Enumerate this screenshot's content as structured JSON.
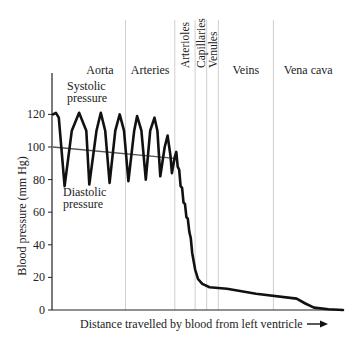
{
  "chart_data": {
    "type": "line",
    "title": "",
    "xlabel": "Distance travelled by blood from left ventricle",
    "ylabel": "Blood pressure (mm Hg)",
    "ylim": [
      0,
      130
    ],
    "yticks": [
      0,
      20,
      40,
      60,
      80,
      100,
      120
    ],
    "grid": false,
    "x_arrow": true,
    "regions": [
      {
        "name": "Aorta",
        "x_start": 0,
        "x_end": 0.25,
        "orientation": "horizontal"
      },
      {
        "name": "Arteries",
        "x_start": 0.25,
        "x_end": 0.42,
        "orientation": "horizontal"
      },
      {
        "name": "Arterioles",
        "x_start": 0.42,
        "x_end": 0.49,
        "orientation": "vertical"
      },
      {
        "name": "Capillaries",
        "x_start": 0.49,
        "x_end": 0.53,
        "orientation": "vertical"
      },
      {
        "name": "Venules",
        "x_start": 0.53,
        "x_end": 0.57,
        "orientation": "vertical"
      },
      {
        "name": "Veins",
        "x_start": 0.57,
        "x_end": 0.76,
        "orientation": "horizontal"
      },
      {
        "name": "Vena cava",
        "x_start": 0.76,
        "x_end": 1.0,
        "orientation": "horizontal"
      }
    ],
    "annotations": [
      {
        "text": [
          "Systolic",
          "pressure"
        ],
        "near": "aorta peaks"
      },
      {
        "text": [
          "Diastolic",
          "pressure"
        ],
        "near": "aorta troughs"
      }
    ],
    "series": [
      {
        "name": "Blood pressure",
        "points": [
          [
            0.0,
            120
          ],
          [
            0.01,
            121
          ],
          [
            0.02,
            118
          ],
          [
            0.04,
            76
          ],
          [
            0.065,
            110
          ],
          [
            0.09,
            121
          ],
          [
            0.115,
            110
          ],
          [
            0.125,
            77
          ],
          [
            0.15,
            110
          ],
          [
            0.165,
            121
          ],
          [
            0.18,
            110
          ],
          [
            0.195,
            78
          ],
          [
            0.215,
            110
          ],
          [
            0.23,
            120
          ],
          [
            0.245,
            110
          ],
          [
            0.26,
            79
          ],
          [
            0.28,
            110
          ],
          [
            0.29,
            119
          ],
          [
            0.305,
            110
          ],
          [
            0.32,
            80
          ],
          [
            0.335,
            110
          ],
          [
            0.35,
            118
          ],
          [
            0.36,
            110
          ],
          [
            0.37,
            82
          ],
          [
            0.385,
            100
          ],
          [
            0.395,
            107
          ],
          [
            0.405,
            95
          ],
          [
            0.41,
            84
          ],
          [
            0.42,
            94
          ],
          [
            0.425,
            97
          ],
          [
            0.43,
            88
          ],
          [
            0.435,
            86
          ],
          [
            0.44,
            76
          ],
          [
            0.445,
            75
          ],
          [
            0.45,
            66
          ],
          [
            0.455,
            65
          ],
          [
            0.46,
            57
          ],
          [
            0.465,
            56
          ],
          [
            0.47,
            48
          ],
          [
            0.475,
            44
          ],
          [
            0.48,
            35
          ],
          [
            0.49,
            25
          ],
          [
            0.5,
            19
          ],
          [
            0.515,
            16
          ],
          [
            0.54,
            14
          ],
          [
            0.6,
            13
          ],
          [
            0.7,
            10
          ],
          [
            0.84,
            7
          ],
          [
            0.87,
            4
          ],
          [
            0.9,
            1.5
          ],
          [
            0.95,
            0.5
          ],
          [
            1.0,
            0
          ]
        ]
      },
      {
        "name": "Mean pressure",
        "points": [
          [
            0.0,
            100
          ],
          [
            0.42,
            93
          ]
        ]
      }
    ]
  },
  "labels": {
    "ylabel": "Blood pressure (mm Hg)",
    "xlabel": "Distance travelled by blood from left ventricle",
    "arrow": "→",
    "systolic": [
      "Systolic",
      "pressure"
    ],
    "diastolic": [
      "Diastolic",
      "pressure"
    ]
  }
}
